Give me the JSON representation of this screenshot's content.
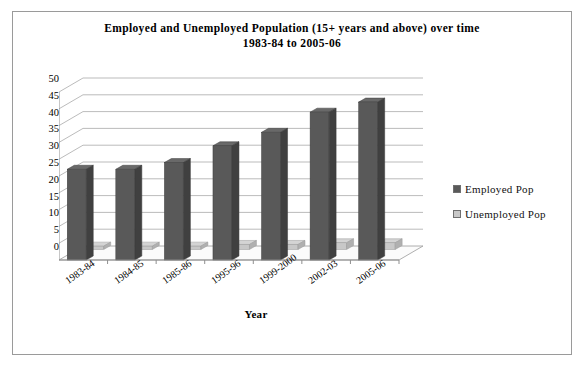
{
  "chart_data": {
    "type": "bar",
    "title": "Employed and Unemployed Population (15+ years and above) over time 1983-84 to 2005-06",
    "title_lines": [
      "Employed and Unemployed Population (15+ years and above) over time",
      "1983-84 to 2005-06"
    ],
    "categories": [
      "1983-84",
      "1984-85",
      "1985-86",
      "1995-96",
      "1999-2000",
      "2002-03",
      "2005-06"
    ],
    "series": [
      {
        "name": "Employed Pop",
        "color": "#595959",
        "values": [
          27,
          27,
          29,
          34,
          38,
          44,
          47
        ]
      },
      {
        "name": "Unemployed Pop",
        "color": "#c8c8c8",
        "values": [
          1,
          1,
          1,
          1.5,
          1.5,
          2,
          2
        ]
      }
    ],
    "xlabel": "Year",
    "ylabel": "",
    "ylim": [
      0,
      50
    ],
    "yticks": [
      0,
      5,
      10,
      15,
      20,
      25,
      30,
      35,
      40,
      45,
      50
    ],
    "grid": true,
    "legend_position": "right",
    "style": "3d-column"
  },
  "legend": {
    "items": [
      {
        "label": "Employed Pop",
        "color": "#595959"
      },
      {
        "label": "Unemployed Pop",
        "color": "#c8c8c8"
      }
    ]
  }
}
